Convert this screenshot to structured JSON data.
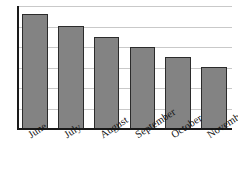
{
  "chart_data": {
    "type": "bar",
    "title": "",
    "subtitle": "",
    "xlabel": "",
    "ylabel": "",
    "categories": [
      "June",
      "July",
      "August",
      "September",
      "October",
      "November"
    ],
    "values": [
      7.0,
      6.3,
      5.6,
      5.0,
      4.4,
      3.8
    ],
    "series": [
      {
        "name": "",
        "values": [
          7.0,
          6.3,
          5.6,
          5.0,
          4.4,
          3.8
        ]
      }
    ],
    "ylim": [
      0,
      7.5
    ],
    "xlim": [
      0,
      6
    ],
    "y_tick_values": [
      0,
      1.25,
      2.5,
      3.75,
      5.0,
      6.25,
      7.5
    ],
    "y_tick_labels": [
      "",
      "",
      "",
      "",
      "",
      "",
      ""
    ],
    "grid": true,
    "grid_axis": "y",
    "grid_color": "#c9c9c9",
    "legend": false,
    "legend_position": "none",
    "annotations": [],
    "bar_fill_color": "#838383",
    "bar_edge_color": "#2b2b2b",
    "axis_color": "#1a1a1a",
    "background_color": "#ffffff",
    "tick_label_rotation": -33,
    "bar_width_fraction": 0.72
  },
  "figure": {
    "width_px": 238,
    "height_px": 195
  }
}
